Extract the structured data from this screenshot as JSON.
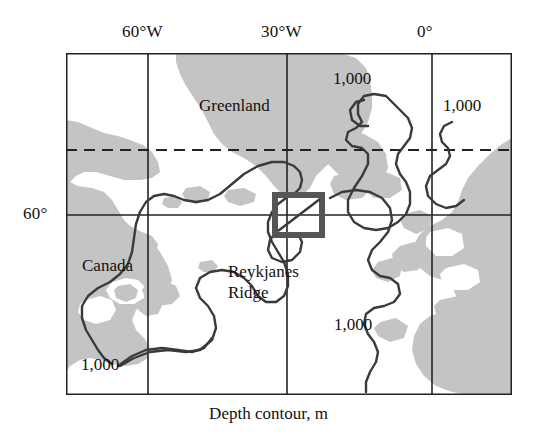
{
  "figure": {
    "caption": "Depth contour, m",
    "frame": {
      "left": 66,
      "top": 53,
      "right": 512,
      "bottom": 395
    },
    "colors": {
      "land": "#c4c4c4",
      "frame": "#222222",
      "grid": "#222222",
      "contour": "#3a3a3a",
      "box": "#555555",
      "background": "#ffffff",
      "text": "#111111"
    }
  },
  "axes": {
    "longitude_ticks": [
      {
        "label": "60°W",
        "x": 148
      },
      {
        "label": "30°W",
        "x": 287
      },
      {
        "label": "0°",
        "x": 432
      }
    ],
    "latitude_ticks": [
      {
        "label": "60°",
        "y": 215
      }
    ],
    "dashed_latitude": {
      "label": "",
      "y": 150
    }
  },
  "map": {
    "region_labels": [
      {
        "name": "Greenland",
        "text": "Greenland",
        "x": 199,
        "y": 96
      },
      {
        "name": "Canada",
        "text": "Canada",
        "x": 82,
        "y": 256
      },
      {
        "name": "Reykjanes Ridge line 1",
        "text": "Reykjanes",
        "x": 228,
        "y": 263
      },
      {
        "name": "Reykjanes Ridge line 2",
        "text": "Ridge",
        "x": 228,
        "y": 284
      }
    ],
    "contour_labels": [
      {
        "text": "1,000",
        "x": 333,
        "y": 69
      },
      {
        "text": "1,000",
        "x": 443,
        "y": 96
      },
      {
        "text": "1,000",
        "x": 334,
        "y": 315
      },
      {
        "text": "1,000",
        "x": 81,
        "y": 355
      }
    ],
    "study_box": {
      "name": "reykjanes-ridge-study-area",
      "x": 272,
      "y": 192,
      "width": 52,
      "height": 46,
      "border_width": 6,
      "has_diagonal": true
    }
  }
}
